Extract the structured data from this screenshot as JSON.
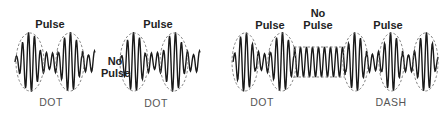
{
  "diagram": {
    "left_panel": {
      "labels": {
        "pulse_1": "Pulse",
        "no_pulse": "No\nPulse",
        "pulse_2": "Pulse",
        "dot_1": "DOT",
        "dot_2": "DOT"
      }
    },
    "right_panel": {
      "labels": {
        "pulse_1": "Pulse",
        "no_pulse": "No\nPulse",
        "pulse_2": "Pulse",
        "dot": "DOT",
        "dash": "DASH"
      }
    },
    "colors": {
      "waveform": "#1a1a1a",
      "envelope": "#777777",
      "text": "#2b2b2b",
      "background": "#ffffff"
    }
  }
}
